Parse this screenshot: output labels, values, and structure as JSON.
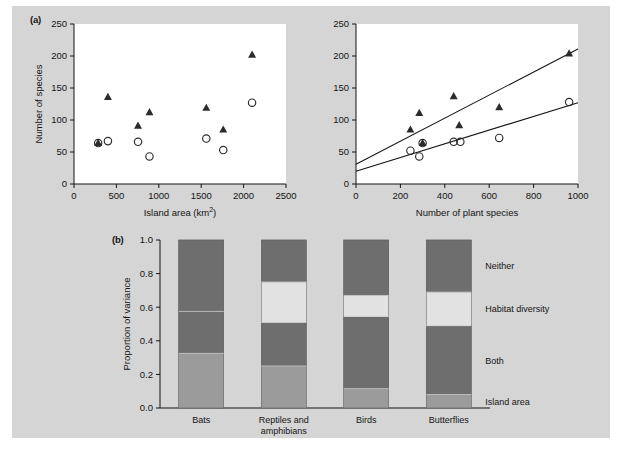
{
  "figure": {
    "background_color": "#d5d5d5",
    "panel_background": "#ffffff",
    "ink_color": "#141414"
  },
  "panels": {
    "a_label": "(a)",
    "b_label": "(b)"
  },
  "chart_data": [
    {
      "type": "scatter",
      "panel": "(a) left",
      "title": "",
      "xlabel": "Island area (km2)",
      "xlabel_display": "Island area (km²)",
      "ylabel": "Number of species",
      "xlim": [
        0,
        2500
      ],
      "ylim": [
        0,
        250
      ],
      "xticks": [
        0,
        500,
        1000,
        1500,
        2000,
        2500
      ],
      "yticks": [
        0,
        50,
        100,
        150,
        200,
        250
      ],
      "grid": false,
      "legend": "none",
      "series": [
        {
          "name": "plant species (filled triangle)",
          "marker": "triangle-filled",
          "color": "#2b2b2b",
          "points": [
            {
              "x": 285,
              "y": 64
            },
            {
              "x": 400,
              "y": 136
            },
            {
              "x": 755,
              "y": 91
            },
            {
              "x": 890,
              "y": 112
            },
            {
              "x": 1560,
              "y": 119
            },
            {
              "x": 1760,
              "y": 85
            },
            {
              "x": 2100,
              "y": 202
            }
          ]
        },
        {
          "name": "animal species (open circle)",
          "marker": "circle-open",
          "color": "#2b2b2b",
          "points": [
            {
              "x": 285,
              "y": 64
            },
            {
              "x": 400,
              "y": 67
            },
            {
              "x": 755,
              "y": 66
            },
            {
              "x": 890,
              "y": 43
            },
            {
              "x": 1560,
              "y": 71
            },
            {
              "x": 1760,
              "y": 53
            },
            {
              "x": 2100,
              "y": 127
            }
          ]
        }
      ]
    },
    {
      "type": "scatter",
      "panel": "(a) right",
      "title": "",
      "xlabel": "Number of plant species",
      "ylabel": "",
      "xlim": [
        0,
        1000
      ],
      "ylim": [
        0,
        250
      ],
      "xticks": [
        0,
        200,
        400,
        600,
        800,
        1000
      ],
      "yticks": [
        0,
        50,
        100,
        150,
        200,
        250
      ],
      "grid": false,
      "legend": "none",
      "series": [
        {
          "name": "filled triangle",
          "marker": "triangle-filled",
          "color": "#2b2b2b",
          "points": [
            {
              "x": 245,
              "y": 85
            },
            {
              "x": 285,
              "y": 111
            },
            {
              "x": 300,
              "y": 64
            },
            {
              "x": 440,
              "y": 137
            },
            {
              "x": 465,
              "y": 92
            },
            {
              "x": 645,
              "y": 120
            },
            {
              "x": 960,
              "y": 204
            }
          ]
        },
        {
          "name": "open circle",
          "marker": "circle-open",
          "color": "#2b2b2b",
          "points": [
            {
              "x": 245,
              "y": 52
            },
            {
              "x": 285,
              "y": 43
            },
            {
              "x": 300,
              "y": 64
            },
            {
              "x": 440,
              "y": 66
            },
            {
              "x": 470,
              "y": 66
            },
            {
              "x": 645,
              "y": 72
            },
            {
              "x": 960,
              "y": 128
            }
          ]
        }
      ],
      "trendlines": [
        {
          "name": "upper regression",
          "x0": 0,
          "y0": 31,
          "x1": 1000,
          "y1": 211
        },
        {
          "name": "lower regression",
          "x0": 0,
          "y0": 20,
          "x1": 1000,
          "y1": 127
        }
      ]
    },
    {
      "type": "bar",
      "panel": "(b)",
      "stacked": true,
      "title": "",
      "xlabel": "",
      "ylabel": "Proportion of variance",
      "ylim": [
        0,
        1.0
      ],
      "yticks": [
        "0.0",
        "0.2",
        "0.4",
        "0.6",
        "0.8",
        "1.0"
      ],
      "ytick_values": [
        0.0,
        0.2,
        0.4,
        0.6,
        0.8,
        1.0
      ],
      "grid": false,
      "legend_position": "right",
      "categories": [
        "Bats",
        "Reptiles and amphibians",
        "Birds",
        "Butterflies"
      ],
      "category_lines": [
        [
          "Bats"
        ],
        [
          "Reptiles and",
          "amphibians"
        ],
        [
          "Birds"
        ],
        [
          "Butterflies"
        ]
      ],
      "series": [
        {
          "name": "Island area",
          "color": "#9b9b9b",
          "values": [
            0.325,
            0.25,
            0.115,
            0.08
          ]
        },
        {
          "name": "Both",
          "color": "#6e6e6e",
          "values": [
            0.25,
            0.26,
            0.43,
            0.41
          ]
        },
        {
          "name": "Habitat diversity",
          "color": "#e2e2e2",
          "values": [
            0.0,
            0.24,
            0.125,
            0.2
          ]
        },
        {
          "name": "Neither",
          "color": "#6e6e6e",
          "values": [
            0.425,
            0.25,
            0.33,
            0.31
          ]
        }
      ],
      "legend_entries": [
        "Neither",
        "Habitat diversity",
        "Both",
        "Island area"
      ]
    }
  ]
}
